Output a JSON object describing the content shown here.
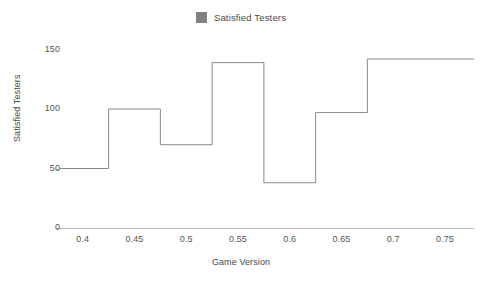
{
  "legend": {
    "position": "top-center",
    "items": [
      {
        "label": "Satisfied Testers",
        "color": "#808080",
        "marker": "square"
      }
    ]
  },
  "axes": {
    "x_title": "Game Version",
    "y_title": "Satisfied Testers",
    "x_ticks": [
      "0.4",
      "0.45",
      "0.5",
      "0.55",
      "0.6",
      "0.65",
      "0.7",
      "0.75"
    ],
    "y_ticks": [
      "0",
      "50",
      "100",
      "150"
    ]
  },
  "chart_data": {
    "type": "line",
    "subtype": "step-post",
    "title": "",
    "subtitle": "",
    "xlabel": "Game Version",
    "ylabel": "Satisfied Testers",
    "xlim": [
      0.378,
      0.778
    ],
    "ylim": [
      0,
      158
    ],
    "xticks": [
      0.4,
      0.45,
      0.5,
      0.55,
      0.6,
      0.65,
      0.7,
      0.75
    ],
    "yticks": [
      0,
      50,
      100,
      150
    ],
    "grid": false,
    "legend_position": "top-center",
    "line_color": "#8a8a8a",
    "line_width": 1,
    "series": [
      {
        "name": "Satisfied Testers",
        "color": "#8a8a8a",
        "x": [
          0.378,
          0.425,
          0.475,
          0.525,
          0.575,
          0.625,
          0.675,
          0.778
        ],
        "values": [
          50,
          100,
          70,
          139,
          38,
          97,
          142,
          142
        ],
        "steps": [
          {
            "x_start": 0.378,
            "x_end": 0.425,
            "value": 50
          },
          {
            "x_start": 0.425,
            "x_end": 0.475,
            "value": 100
          },
          {
            "x_start": 0.475,
            "x_end": 0.525,
            "value": 70
          },
          {
            "x_start": 0.525,
            "x_end": 0.575,
            "value": 139
          },
          {
            "x_start": 0.575,
            "x_end": 0.625,
            "value": 38
          },
          {
            "x_start": 0.625,
            "x_end": 0.675,
            "value": 97
          },
          {
            "x_start": 0.675,
            "x_end": 0.778,
            "value": 142
          }
        ]
      }
    ]
  }
}
